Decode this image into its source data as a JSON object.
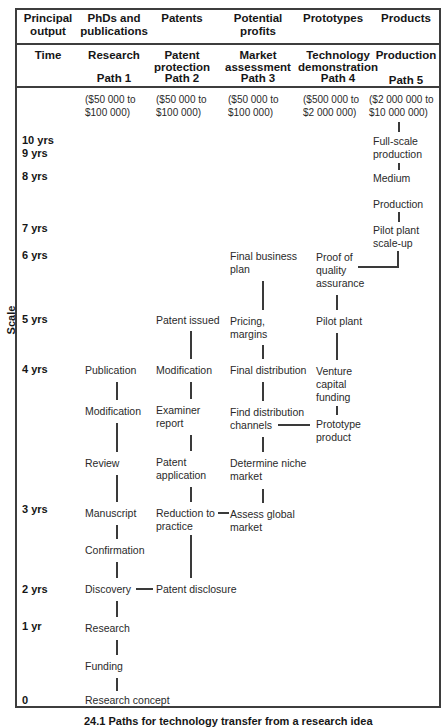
{
  "scale_label": "Scale",
  "caption": "24.1 Paths for technology transfer from a research idea",
  "header": {
    "row1": [
      "Principal\noutput",
      "PhDs and\npublications",
      "Patents",
      "Potential\nprofits",
      "Prototypes",
      "Products"
    ],
    "time": "Time",
    "row2": [
      {
        "title": "Research",
        "path": "Path 1"
      },
      {
        "title": "Patent\nprotection",
        "path": "Path 2"
      },
      {
        "title": "Market\nassessment",
        "path": "Path 3"
      },
      {
        "title": "Technology\ndemonstration",
        "path": "Path 4"
      },
      {
        "title": "Production",
        "path": "Path 5"
      }
    ]
  },
  "costs": [
    "($50 000 to\n$100 000)",
    "($50 000 to\n$100 000)",
    "($50 000 to\n$100 000)",
    "($500 000 to\n$2 000 000)",
    "($2 000 000 to\n$10 000 000)"
  ],
  "time_labels": [
    "10 yrs",
    "9 yrs",
    "8 yrs",
    "7 yrs",
    "6 yrs",
    "5 yrs",
    "4 yrs",
    "3 yrs",
    "2 yrs",
    "1 yr",
    "0"
  ],
  "p1": [
    "Publication",
    "Modification",
    "Review",
    "Manuscript",
    "Confirmation",
    "Discovery",
    "Research",
    "Funding",
    "Research concept"
  ],
  "p2": [
    "Patent issued",
    "Modification",
    "Examiner\nreport",
    "Patent\napplication",
    "Reduction to\npractice",
    "Patent disclosure"
  ],
  "p3": [
    "Final business\nplan",
    "Pricing,\nmargins",
    "Final distribution",
    "Find distribution\nchannels",
    "Determine niche\nmarket",
    "Assess global\nmarket"
  ],
  "p4": [
    "Proof of\nquality\nassurance",
    "Pilot plant",
    "Venture\ncapital\nfunding",
    "Prototype\nproduct"
  ],
  "p5": [
    "Full-scale\nproduction",
    "Medium",
    "Production",
    "Pilot plant\nscale-up"
  ]
}
